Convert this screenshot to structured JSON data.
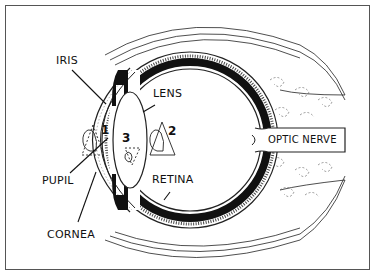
{
  "diagram": {
    "labels": {
      "iris": "IRIS",
      "lens": "LENS",
      "pupil": "PUPIL",
      "retina": "RETINA",
      "cornea": "CORNEA",
      "optic_nerve": "OPTIC NERVE"
    },
    "numbers": {
      "n1": "1",
      "n2": "2",
      "n3": "3"
    },
    "colors": {
      "ink": "#111111",
      "background": "#ffffff",
      "frame": "#555555"
    }
  }
}
